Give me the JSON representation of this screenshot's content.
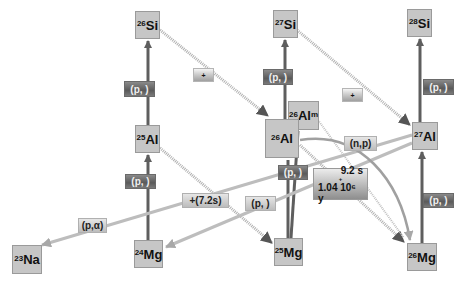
{
  "diagram": {
    "nuclei": [
      {
        "id": "si26",
        "mass": "26",
        "symbol": "Si"
      },
      {
        "id": "si27",
        "mass": "27",
        "symbol": "Si"
      },
      {
        "id": "si28",
        "mass": "28",
        "symbol": "Si"
      },
      {
        "id": "al25",
        "mass": "25",
        "symbol": "Al"
      },
      {
        "id": "al26",
        "mass": "26",
        "symbol": "Al"
      },
      {
        "id": "al26m",
        "mass": "26",
        "symbol": "Al",
        "suffix": "m"
      },
      {
        "id": "al27",
        "mass": "27",
        "symbol": "Al"
      },
      {
        "id": "na23",
        "mass": "23",
        "symbol": "Na"
      },
      {
        "id": "mg24",
        "mass": "24",
        "symbol": "Mg"
      },
      {
        "id": "mg25",
        "mass": "25",
        "symbol": "Mg"
      },
      {
        "id": "mg26",
        "mass": "26",
        "symbol": "Mg"
      }
    ],
    "labels": {
      "pg_al25_si26": "(p, )",
      "pg_al26_si27": "(p, )",
      "pg_al27_si28": "(p, )",
      "pg_mg24_al25": "(p, )",
      "pg_mg25_al26": "(p, )",
      "pg_mg26_al27": "(p, )",
      "beta_si26": "+",
      "beta_si27": "+",
      "beta_al25": "+(7.2s)",
      "pa_al27_na23": "(p,α)",
      "pa_al27_mg24": "(p, )",
      "np_al26_mg26": "(n,p)",
      "al26_decay_line1": "9.2 s",
      "al26_decay_line2": "+",
      "al26_decay_line3": "1.04 10⁶ y"
    },
    "colors": {
      "nucleus_fill": "#c6c6c6",
      "arrow_dark": "#5e5e5e",
      "arrow_light": "#bdbdbd",
      "beta_dotted": "#a8a8a8"
    }
  }
}
